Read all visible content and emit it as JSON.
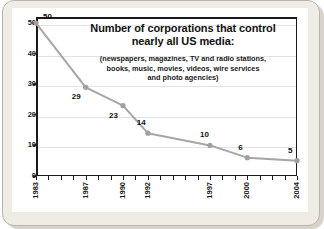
{
  "chart_data": {
    "type": "line",
    "title": "Number of corporations that control nearly all US media:",
    "title_line1": "Number of corporations that control",
    "title_line2": "nearly all US media:",
    "subtitle": "(newspapers, magazines, TV and radio stations, books, music, movies, videos, wire services and photo agencies)",
    "subtitle_line1": "(newspapers, magazines, TV and radio stations,",
    "subtitle_line2": "books, music, movies, videos, wire services",
    "subtitle_line3": "and photo agencies)",
    "xlabel": "",
    "ylabel": "",
    "x": [
      1983,
      1987,
      1990,
      1992,
      1997,
      2000,
      2004
    ],
    "categories": [
      "1983",
      "1987",
      "1990",
      "1992",
      "1997",
      "2000",
      "2004"
    ],
    "values": [
      50,
      29,
      23,
      14,
      10,
      6,
      5
    ],
    "point_labels": [
      "50",
      "29",
      "23",
      "14",
      "10",
      "6",
      "5"
    ],
    "xlim": [
      1983,
      2004
    ],
    "ylim": [
      0,
      52
    ],
    "y_ticks": [
      "0",
      "10",
      "20",
      "30",
      "40",
      "50"
    ],
    "y_tick_values": [
      0,
      10,
      20,
      30,
      40,
      50
    ],
    "x_ticks_all": [
      "1983",
      "1984",
      "1985",
      "1986",
      "1987",
      "1988",
      "1989",
      "1990",
      "1991",
      "1992",
      "1993",
      "1994",
      "1995",
      "1996",
      "1997",
      "1998",
      "1999",
      "2000",
      "2001",
      "2002",
      "2003",
      "2004"
    ],
    "grid": true,
    "legend": "none",
    "series_color": "#a6a6a6",
    "marker_color": "#a0a0a0",
    "text_color": "#111111",
    "grid_color": "#e3e3e3",
    "axis_color": "#1a1a1a",
    "plot_background": "#ffffff",
    "card_background": "#ffffff",
    "frame_background": "#efece6"
  }
}
